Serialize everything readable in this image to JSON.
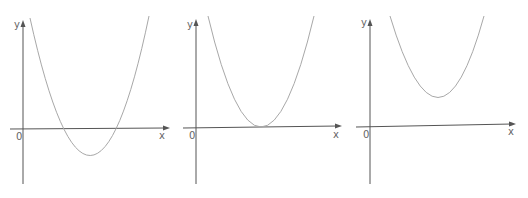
{
  "figure": {
    "panels": [
      {
        "id": "panel-1",
        "description": "Upward parabola crossing the x-axis at two points, vertex below x-axis",
        "labels": {
          "y": "y",
          "x": "x",
          "origin": "0"
        },
        "roots": 2,
        "vertex_position": "below x-axis"
      },
      {
        "id": "panel-2",
        "description": "Upward parabola tangent to the x-axis, vertex on x-axis",
        "labels": {
          "y": "y",
          "x": "x",
          "origin": "0"
        },
        "roots": 1,
        "vertex_position": "on x-axis"
      },
      {
        "id": "panel-3",
        "description": "Upward parabola entirely above the x-axis, vertex above x-axis",
        "labels": {
          "y": "y",
          "x": "x",
          "origin": "0"
        },
        "roots": 0,
        "vertex_position": "above x-axis"
      }
    ],
    "colors": {
      "axis": "#555555",
      "curve": "#a8a8a8",
      "label": "#666666",
      "background": "#ffffff"
    }
  }
}
